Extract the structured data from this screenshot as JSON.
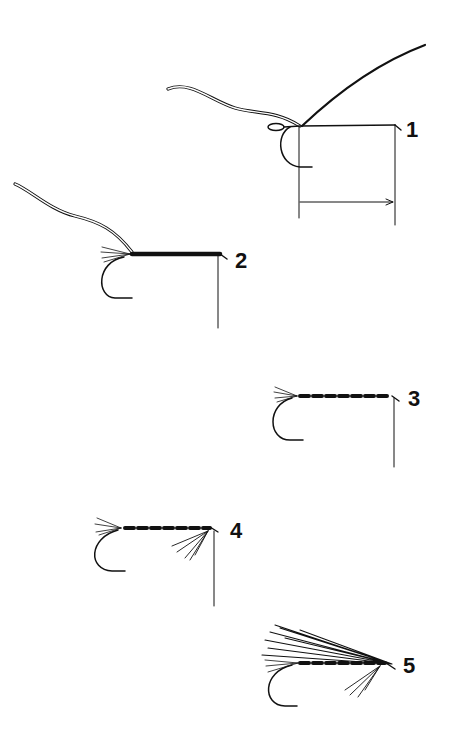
{
  "diagram": {
    "type": "fly-tying-steps",
    "background": "#ffffff",
    "ink_color": "#111111",
    "steps": [
      {
        "label": "1",
        "description": "thread attached at hook eye, rib wire tied in, tail length marked"
      },
      {
        "label": "2",
        "description": "tail tied in, body wrapped solid black"
      },
      {
        "label": "3",
        "description": "tinsel rib spiraled over body"
      },
      {
        "label": "4",
        "description": "throat hackle tied under hook shank"
      },
      {
        "label": "5",
        "description": "wing tied over body, fly complete"
      }
    ]
  }
}
